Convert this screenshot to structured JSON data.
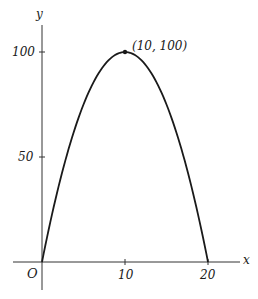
{
  "chart_data": {
    "type": "line",
    "title": "",
    "xlabel": "x",
    "ylabel": "y",
    "origin_label": "O",
    "x_ticks": [
      10,
      20
    ],
    "x_tick_labels": [
      "10",
      "20"
    ],
    "y_ticks": [
      50,
      100
    ],
    "y_tick_labels": [
      "50",
      "100"
    ],
    "xlim": [
      0,
      20
    ],
    "ylim": [
      0,
      100
    ],
    "grid": false,
    "legend": null,
    "series": [
      {
        "name": "parabola",
        "equation": "y = 20x - x^2",
        "x": [
          0,
          2,
          4,
          6,
          8,
          10,
          12,
          14,
          16,
          18,
          20
        ],
        "y": [
          0,
          36,
          64,
          84,
          96,
          100,
          96,
          84,
          64,
          36,
          0
        ]
      }
    ],
    "annotations": [
      {
        "text": "(10, 100)",
        "x": 10,
        "y": 100,
        "marker": "dot"
      }
    ]
  },
  "labels": {
    "y_axis": "y",
    "x_axis": "x",
    "origin": "O",
    "y_tick_100": "100",
    "y_tick_50": "50",
    "x_tick_10": "10",
    "x_tick_20": "20",
    "vertex": "(10, 100)"
  },
  "colors": {
    "line": "#1a1a1a",
    "axis": "#333333",
    "background": "#ffffff"
  }
}
